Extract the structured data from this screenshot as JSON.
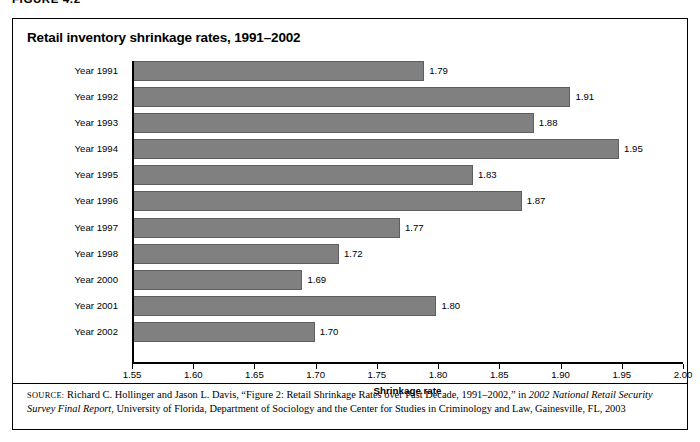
{
  "figure_header": "FIGURE 4.2",
  "chart_title": "Retail inventory shrinkage rates, 1991–2002",
  "axis": {
    "x_title": "Shrinkage rate"
  },
  "source": {
    "kicker": "SOURCE:",
    "part1": " Richard C. Hollinger and Jason L. Davis, “Figure 2: Retail Shrinkage Rates over Past Decade, 1991–2002,” in ",
    "italic1": "2002 National Retail Security Survey Final Report",
    "part2": ", University of Florida, Department of Sociology and the Center for Studies in Criminology and Law, Gainesville, FL, 2003"
  },
  "chart_data": {
    "type": "bar",
    "orientation": "horizontal",
    "title": "Retail inventory shrinkage rates, 1991–2002",
    "xlabel": "Shrinkage rate",
    "ylabel": "",
    "xlim": [
      1.55,
      2.0
    ],
    "xtick_step": 0.05,
    "xticks": [
      "1.55",
      "1.60",
      "1.65",
      "1.70",
      "1.75",
      "1.80",
      "1.85",
      "1.90",
      "1.95",
      "2.00"
    ],
    "grid": false,
    "legend": false,
    "bar_color": "#808080",
    "bar_edge_color": "#5e5e5e",
    "categories": [
      "Year 1991",
      "Year 1992",
      "Year 1993",
      "Year 1994",
      "Year 1995",
      "Year 1996",
      "Year 1997",
      "Year 1998",
      "Year 2000",
      "Year 2001",
      "Year 2002"
    ],
    "values": [
      1.79,
      1.91,
      1.88,
      1.95,
      1.83,
      1.87,
      1.77,
      1.72,
      1.69,
      1.8,
      1.7
    ],
    "value_labels": [
      "1.79",
      "1.91",
      "1.88",
      "1.95",
      "1.83",
      "1.87",
      "1.77",
      "1.72",
      "1.69",
      "1.80",
      "1.70"
    ]
  }
}
